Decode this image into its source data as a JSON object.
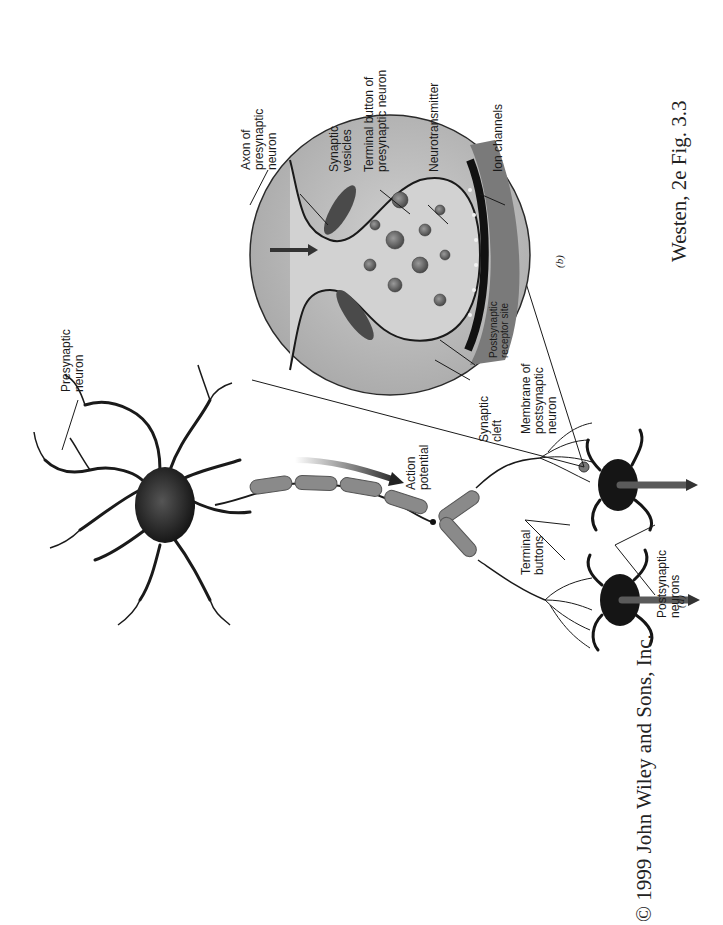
{
  "figure": {
    "orientation": "rotated-90-ccw",
    "caption_source": "Westen, 2e Fig. 3.3",
    "copyright": "© 1999 John Wiley and Sons, Inc.",
    "panels": [
      {
        "id": "a",
        "label": "(a)"
      },
      {
        "id": "b",
        "label": "(b)"
      }
    ],
    "labels": {
      "presynaptic_neuron": "Presynaptic\nneuron",
      "action_potential": "Action\npotential",
      "terminal_buttons": "Terminal\nbuttons",
      "postsynaptic_neurons": "Postsynaptic\nneurons",
      "axon_of_presynaptic_neuron": "Axon of\npresynaptic\nneuron",
      "synaptic_vesicles": "Synaptic\nvesicles",
      "terminal_button_of_presynaptic_neuron": "Terminal button of\npresynaptic neuron",
      "neurotransmitter": "Neurotransmitter",
      "ion_channels": "Ion channels",
      "postsynaptic_receptor_site": "Postsynaptic\nreceptor site",
      "synaptic_cleft": "Synaptic\ncleft",
      "membrane_of_postsynaptic_neuron": "Membrane of\npostsynaptic\nneuron"
    },
    "colors": {
      "background": "#ffffff",
      "ink": "#1a1a1a",
      "myelin": "#8a8a8a",
      "inset_fill": "#b9b9b9",
      "terminal_fill": "#cfcfcf",
      "postsynaptic_fill": "#6e6e6e"
    }
  }
}
